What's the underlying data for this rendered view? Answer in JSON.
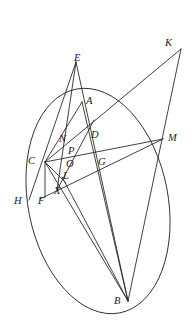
{
  "figure": {
    "type": "geometric-diagram",
    "canvas": {
      "width": 194,
      "height": 334,
      "background": "#ffffff"
    },
    "stroke_color": "#2b2b2b",
    "label_color": "#1a1a1a",
    "conic": {
      "name": "ellipse",
      "center_x": 98,
      "center_y": 201,
      "radius_x": 70,
      "radius_y": 114,
      "rotation_deg": -11
    },
    "points": [
      {
        "id": "E",
        "label": "E",
        "x": 76,
        "y": 62,
        "label_x": 74,
        "label_y": 53,
        "on_conic": false
      },
      {
        "id": "K",
        "label": "K",
        "x": 181,
        "y": 49,
        "label_x": 165,
        "label_y": 38,
        "on_conic": false
      },
      {
        "id": "A",
        "label": "A",
        "x": 82,
        "y": 102,
        "label_x": 86,
        "label_y": 96,
        "on_conic": true
      },
      {
        "id": "D",
        "label": "D",
        "x": 88,
        "y": 137,
        "label_x": 91,
        "label_y": 130,
        "on_conic": false
      },
      {
        "id": "M",
        "label": "M",
        "x": 163,
        "y": 139,
        "label_x": 168,
        "label_y": 133,
        "on_conic": false
      },
      {
        "id": "N",
        "label": "N",
        "x": 62,
        "y": 142,
        "label_x": 59,
        "label_y": 134,
        "on_conic": false
      },
      {
        "id": "P",
        "label": "P",
        "x": 71,
        "y": 153,
        "label_x": 68,
        "label_y": 146,
        "on_conic": false
      },
      {
        "id": "C",
        "label": "C",
        "x": 45,
        "y": 162,
        "label_x": 28,
        "label_y": 156,
        "on_conic": true
      },
      {
        "id": "O",
        "label": "O",
        "x": 69,
        "y": 164,
        "label_x": 66,
        "label_y": 159,
        "on_conic": false
      },
      {
        "id": "G",
        "label": "G",
        "x": 95,
        "y": 162,
        "label_x": 98,
        "label_y": 157,
        "on_conic": false
      },
      {
        "id": "L",
        "label": "L",
        "x": 62,
        "y": 177,
        "label_x": 63,
        "label_y": 171,
        "on_conic": false
      },
      {
        "id": "X",
        "label": "X",
        "x": 57,
        "y": 190,
        "label_x": 54,
        "label_y": 186,
        "on_conic": false
      },
      {
        "id": "F",
        "label": "F",
        "x": 45,
        "y": 197,
        "label_x": 38,
        "label_y": 196,
        "on_conic": true
      },
      {
        "id": "H",
        "label": "H",
        "x": 29,
        "y": 200,
        "label_x": 14,
        "label_y": 196,
        "on_conic": false
      },
      {
        "id": "B",
        "label": "B",
        "x": 128,
        "y": 301,
        "label_x": 114,
        "label_y": 296,
        "on_conic": true
      }
    ],
    "segments": [
      {
        "id": "E-H",
        "from": "E",
        "to": "H",
        "name": "line-e-h"
      },
      {
        "id": "E-X",
        "from": "E",
        "to": "X",
        "name": "line-e-x"
      },
      {
        "id": "E-B",
        "from": "E",
        "to": "B",
        "name": "line-e-b"
      },
      {
        "id": "C-A",
        "from": "C",
        "to": "A",
        "name": "line-c-a"
      },
      {
        "id": "C-K",
        "from": "C",
        "to": "K",
        "name": "line-c-k"
      },
      {
        "id": "C-M",
        "from": "C",
        "to": "M",
        "name": "line-c-m"
      },
      {
        "id": "C-B",
        "from": "C",
        "to": "B",
        "name": "line-c-b"
      },
      {
        "id": "C-F",
        "from": "C",
        "to": "F",
        "name": "line-c-f"
      },
      {
        "id": "C-L",
        "from": "C",
        "to": "L",
        "name": "line-c-l"
      },
      {
        "id": "K-B",
        "from": "K",
        "to": "B",
        "name": "line-k-b"
      },
      {
        "id": "F-M",
        "from": "F",
        "to": "M",
        "name": "line-f-m"
      },
      {
        "id": "A-B",
        "from": "A",
        "to": "B",
        "name": "line-a-b"
      },
      {
        "id": "X-D",
        "from": "X",
        "to": "D",
        "name": "line-x-d"
      },
      {
        "id": "L-B",
        "from": "L",
        "to": "B",
        "name": "line-l-b"
      }
    ]
  }
}
